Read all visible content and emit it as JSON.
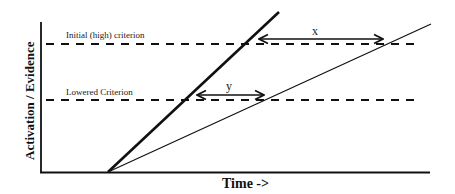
{
  "diagram": {
    "y_axis_label": "Activation / Evidence",
    "x_axis_label": "Time ->",
    "criteria": [
      {
        "label": "Initial (high) criterion",
        "y": 44
      },
      {
        "label": "Lowered Criterion",
        "y": 100
      }
    ],
    "lines": [
      {
        "name": "steep-accumulation-line",
        "style": "thick",
        "x1": 108,
        "y1": 172,
        "x2": 279,
        "y2": 12
      },
      {
        "name": "shallow-accumulation-line",
        "style": "thin",
        "x1": 108,
        "y1": 172,
        "x2": 431,
        "y2": 24
      }
    ],
    "intervals": [
      {
        "label": "x",
        "from_x": 258,
        "to_x": 384,
        "y": 39
      },
      {
        "label": "y",
        "from_x": 196,
        "to_x": 265,
        "y": 95
      }
    ],
    "colors": {
      "line": "#111111",
      "background": "#ffffff"
    }
  }
}
